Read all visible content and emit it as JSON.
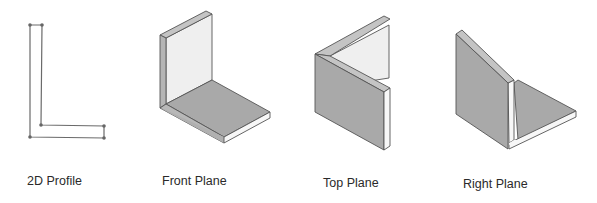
{
  "figures": [
    {
      "id": "2d-profile",
      "label": "2D Profile"
    },
    {
      "id": "front-plane",
      "label": "Front Plane"
    },
    {
      "id": "top-plane",
      "label": "Top Plane"
    },
    {
      "id": "right-plane",
      "label": "Right Plane"
    }
  ],
  "colors": {
    "background": "#ffffff",
    "outline": "#555555",
    "dark_face": "#a9a9a9",
    "light_face": "#efefef",
    "edge_face": "#c4c4c4",
    "bright_edge": "#f7f7f7",
    "vertex": "#666666"
  }
}
